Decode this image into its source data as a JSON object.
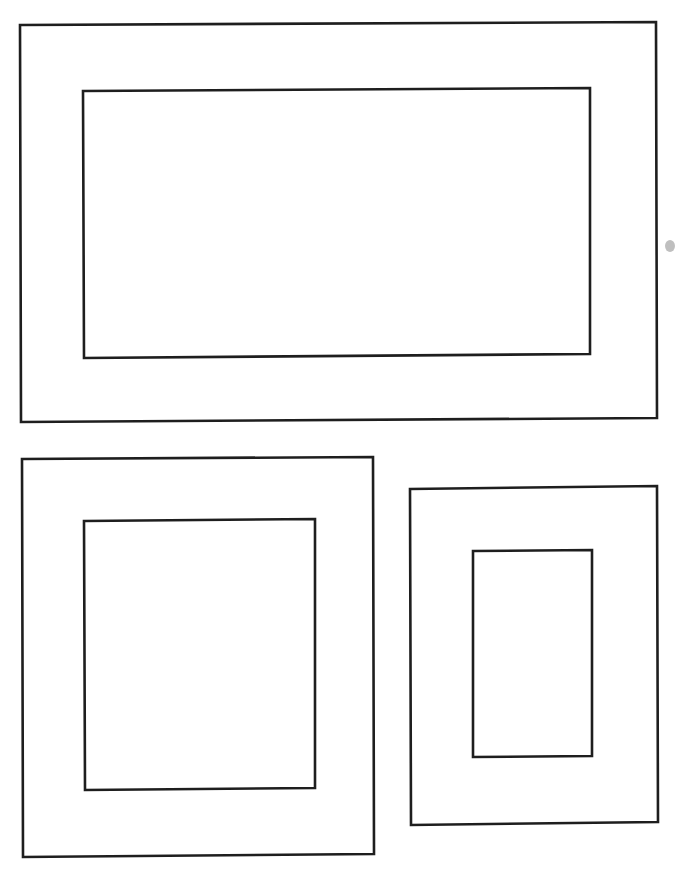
{
  "diagram": {
    "stroke_color": "#1e1e1e",
    "background_color": "#ffffff",
    "frames": [
      {
        "id": "landscape-frame",
        "outer": [
          [
            20,
            25
          ],
          [
            656,
            22
          ],
          [
            657,
            418
          ],
          [
            21,
            422
          ]
        ],
        "inner": [
          [
            83,
            91
          ],
          [
            590,
            88
          ],
          [
            590,
            354
          ],
          [
            84,
            358
          ]
        ]
      },
      {
        "id": "square-frame",
        "outer": [
          [
            22,
            459
          ],
          [
            373,
            457
          ],
          [
            374,
            854
          ],
          [
            23,
            857
          ]
        ],
        "inner": [
          [
            84,
            521
          ],
          [
            315,
            519
          ],
          [
            315,
            788
          ],
          [
            85,
            790
          ]
        ]
      },
      {
        "id": "portrait-frame",
        "outer": [
          [
            410,
            489
          ],
          [
            657,
            486
          ],
          [
            658,
            822
          ],
          [
            411,
            825
          ]
        ],
        "inner": [
          [
            473,
            551
          ],
          [
            592,
            550
          ],
          [
            592,
            756
          ],
          [
            473,
            757
          ]
        ]
      }
    ],
    "artifacts": [
      {
        "id": "scan-smudge",
        "x": 670,
        "y": 246
      }
    ]
  }
}
